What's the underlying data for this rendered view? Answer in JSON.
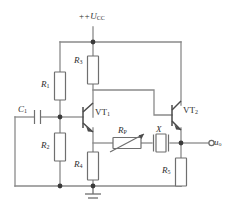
{
  "diagram": {
    "supply_label_prefix": "+",
    "supply_label_symbol": "U",
    "supply_label_sub": "CC"
  },
  "labels": {
    "vcc": {
      "text": "+U",
      "sub": "CC"
    },
    "r1": {
      "text": "R",
      "sub": "1"
    },
    "r2": {
      "text": "R",
      "sub": "2"
    },
    "r3": {
      "text": "R",
      "sub": "3"
    },
    "r4": {
      "text": "R",
      "sub": "4"
    },
    "r5": {
      "text": "R",
      "sub": "5"
    },
    "rp": {
      "text": "R",
      "sub": "P"
    },
    "c1": {
      "text": "C",
      "sub": "1"
    },
    "x": {
      "text": "X",
      "sub": ""
    },
    "vt1": {
      "text": "VT",
      "sub": "1"
    },
    "vt2": {
      "text": "VT",
      "sub": "2"
    },
    "uo": {
      "text": "u",
      "sub": "o"
    }
  },
  "components": [
    {
      "id": "r1",
      "type": "resistor",
      "name": "resistor-r1",
      "label": "R1"
    },
    {
      "id": "r2",
      "type": "resistor",
      "name": "resistor-r2",
      "label": "R2"
    },
    {
      "id": "r3",
      "type": "resistor",
      "name": "resistor-r3",
      "label": "R3"
    },
    {
      "id": "r4",
      "type": "resistor",
      "name": "resistor-r4",
      "label": "R4"
    },
    {
      "id": "r5",
      "type": "resistor",
      "name": "resistor-r5",
      "label": "R5"
    },
    {
      "id": "rp",
      "type": "variable-resistor",
      "name": "variable-resistor-rp",
      "label": "RP"
    },
    {
      "id": "c1",
      "type": "capacitor",
      "name": "capacitor-c1",
      "label": "C1"
    },
    {
      "id": "x",
      "type": "quartz-crystal",
      "name": "quartz-crystal-x",
      "label": "X"
    },
    {
      "id": "vt1",
      "type": "npn-transistor",
      "name": "transistor-vt1",
      "label": "VT1"
    },
    {
      "id": "vt2",
      "type": "npn-transistor",
      "name": "transistor-vt2",
      "label": "VT2"
    },
    {
      "id": "gnd",
      "type": "ground",
      "name": "ground-symbol",
      "label": ""
    },
    {
      "id": "uo",
      "type": "output-terminal",
      "name": "output-terminal-uo",
      "label": "uo"
    }
  ],
  "colors": {
    "wire": "#8a8a8a",
    "component": "#6f6f6f",
    "device": "#4a4a4a",
    "node": "#3a3a3a",
    "text": "#2e2e2e",
    "background": "#ffffff"
  }
}
